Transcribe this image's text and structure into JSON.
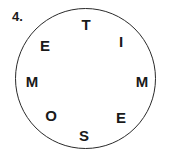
{
  "puzzle": {
    "number": "4.",
    "letters": [
      {
        "char": "T",
        "x": 86,
        "y": 24
      },
      {
        "char": "I",
        "x": 121,
        "y": 41
      },
      {
        "char": "M",
        "x": 142,
        "y": 81
      },
      {
        "char": "E",
        "x": 121,
        "y": 117
      },
      {
        "char": "S",
        "x": 84,
        "y": 135
      },
      {
        "char": "O",
        "x": 51,
        "y": 115
      },
      {
        "char": "M",
        "x": 32,
        "y": 81
      },
      {
        "char": "E",
        "x": 45,
        "y": 45
      }
    ]
  }
}
